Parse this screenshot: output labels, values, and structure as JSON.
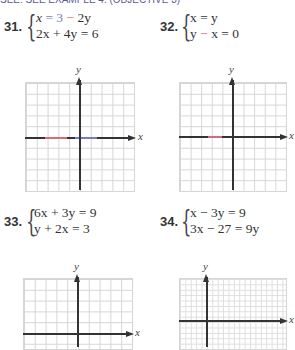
{
  "header": {
    "text": "SEE: SEE EXAMPLE 4. (OBJECTIVE 3)"
  },
  "problems": [
    {
      "number": "31.",
      "equations": [
        {
          "parts": [
            "x",
            " = 3 ",
            "−",
            " 2y"
          ],
          "text": "x = 3 − 2y"
        },
        {
          "text": "2x + 4y = 6"
        }
      ],
      "graph": {
        "x_label": "x",
        "y_label": "y",
        "grid": "10x10"
      }
    },
    {
      "number": "32.",
      "equations": [
        {
          "text": "x = y"
        },
        {
          "parts": [
            "y ",
            "−",
            " x = 0"
          ],
          "text": "y − x = 0"
        }
      ],
      "graph": {
        "x_label": "x",
        "y_label": "y",
        "grid": "10x10"
      }
    },
    {
      "number": "33.",
      "equations": [
        {
          "text": "6x + 3y = 9"
        },
        {
          "text": "y + 2x = 3"
        }
      ],
      "graph": {
        "x_label": "x",
        "y_label": "y",
        "grid": "10x10"
      }
    },
    {
      "number": "34.",
      "equations": [
        {
          "text": "x − 3y = 9"
        },
        {
          "text": "3x − 27 = 9y"
        }
      ],
      "graph": {
        "x_label": "x",
        "y_label": "y",
        "grid": "fine"
      }
    }
  ],
  "colors": {
    "grid_line": "#d6d6d6",
    "axis": "#333333",
    "accent_blue": "#7a7ac8",
    "accent_red": "#d46b7a"
  }
}
